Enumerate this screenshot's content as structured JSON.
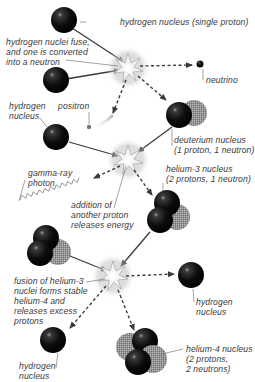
{
  "diagram": {
    "colors": {
      "proton": "#111111",
      "neutron": "#8a8a8a",
      "arrow": "#444444",
      "leader": "#666666",
      "label": "#3a3a3a",
      "background": "#ffffff"
    },
    "labels": {
      "h_single": "hydrogen nucleus (single proton)",
      "fuse": "hydrogen nuclei fuse,\nand one is converted\ninto a neutron",
      "neutrino": "neutrino",
      "h_left": "hydrogen\nnucleus",
      "positron": "positron",
      "deuterium": "deuterium nucleus\n(1 proton, 1 neutron)",
      "gamma": "gamma-ray\nphoton",
      "helium3": "helium-3 nucleus\n(2 protons, 1 neutron)",
      "addition": "addition of\nanother proton\nreleases energy",
      "fusion_he3": "fusion of helium-3\nnuclei forms stable\nhelium-4 and\nreleases excess\nprotons",
      "h_right": "hydrogen\nnucleus",
      "h_bottom": "hydrogen\nnucleus",
      "helium4": "helium-4 nucleus\n(2 protons,\n2 neutrons)"
    },
    "nodes": [
      {
        "id": "h1",
        "type": "proton",
        "label": "hydrogen nucleus (single proton)"
      },
      {
        "id": "h2",
        "type": "proton"
      },
      {
        "id": "fusion1",
        "type": "burst",
        "label": "hydrogen nuclei fuse, and one is converted into a neutron"
      },
      {
        "id": "neutrino",
        "type": "particle",
        "label": "neutrino"
      },
      {
        "id": "positron",
        "type": "particle",
        "label": "positron"
      },
      {
        "id": "deuterium",
        "type": "nucleus",
        "label": "deuterium nucleus (1 proton, 1 neutron)"
      },
      {
        "id": "h3",
        "type": "proton",
        "label": "hydrogen nucleus"
      },
      {
        "id": "fusion2",
        "type": "burst",
        "label": "addition of another proton releases energy"
      },
      {
        "id": "gamma",
        "type": "photon",
        "label": "gamma-ray photon"
      },
      {
        "id": "he3a",
        "type": "nucleus",
        "label": "helium-3 nucleus (2 protons, 1 neutron)"
      },
      {
        "id": "he3b",
        "type": "nucleus"
      },
      {
        "id": "fusion3",
        "type": "burst",
        "label": "fusion of helium-3 nuclei forms stable helium-4 and releases excess protons"
      },
      {
        "id": "h4",
        "type": "proton",
        "label": "hydrogen nucleus"
      },
      {
        "id": "h5",
        "type": "proton",
        "label": "hydrogen nucleus"
      },
      {
        "id": "he4",
        "type": "nucleus",
        "label": "helium-4 nucleus (2 protons, 2 neutrons)"
      }
    ],
    "edges": [
      {
        "from": "h1",
        "to": "fusion1",
        "style": "solid"
      },
      {
        "from": "h2",
        "to": "fusion1",
        "style": "solid"
      },
      {
        "from": "fusion1",
        "to": "neutrino",
        "style": "dashed"
      },
      {
        "from": "fusion1",
        "to": "positron",
        "style": "dashed"
      },
      {
        "from": "fusion1",
        "to": "deuterium",
        "style": "dashed"
      },
      {
        "from": "deuterium",
        "to": "fusion2",
        "style": "solid"
      },
      {
        "from": "h3",
        "to": "fusion2",
        "style": "solid"
      },
      {
        "from": "fusion2",
        "to": "gamma",
        "style": "dashed"
      },
      {
        "from": "fusion2",
        "to": "he3a",
        "style": "dashed"
      },
      {
        "from": "he3a",
        "to": "fusion3",
        "style": "solid"
      },
      {
        "from": "he3b",
        "to": "fusion3",
        "style": "solid"
      },
      {
        "from": "fusion3",
        "to": "h4",
        "style": "dashed"
      },
      {
        "from": "fusion3",
        "to": "h5",
        "style": "dashed"
      },
      {
        "from": "fusion3",
        "to": "he4",
        "style": "dashed"
      }
    ]
  }
}
